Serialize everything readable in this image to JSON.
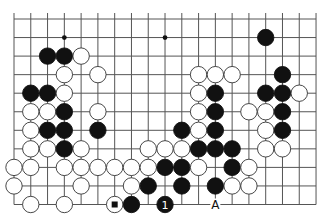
{
  "diagram": {
    "type": "go-board-partial",
    "columns": 19,
    "rows": 11,
    "open_edges": [
      "top"
    ],
    "grid": {
      "x0": 14,
      "y0": 19,
      "dx": 16.78,
      "dy": 18.55,
      "extend_top": 6
    },
    "colors": {
      "line": "#555555",
      "black": "#111111",
      "white": "#ffffff",
      "stone_outline": "#333333",
      "background": "#ffffff"
    },
    "star_points": [
      [
        3,
        1
      ],
      [
        9,
        1
      ],
      [
        15,
        1
      ],
      [
        3,
        7
      ],
      [
        9,
        7
      ],
      [
        15,
        7
      ]
    ],
    "stones": [
      {
        "c": 15,
        "r": 1,
        "color": "black"
      },
      {
        "c": 2,
        "r": 2,
        "color": "black"
      },
      {
        "c": 3,
        "r": 2,
        "color": "black"
      },
      {
        "c": 4,
        "r": 2,
        "color": "white"
      },
      {
        "c": 3,
        "r": 3,
        "color": "white"
      },
      {
        "c": 5,
        "r": 3,
        "color": "white"
      },
      {
        "c": 11,
        "r": 3,
        "color": "white"
      },
      {
        "c": 12,
        "r": 3,
        "color": "white"
      },
      {
        "c": 13,
        "r": 3,
        "color": "white"
      },
      {
        "c": 16,
        "r": 3,
        "color": "black"
      },
      {
        "c": 1,
        "r": 4,
        "color": "black"
      },
      {
        "c": 2,
        "r": 4,
        "color": "black"
      },
      {
        "c": 3,
        "r": 4,
        "color": "white"
      },
      {
        "c": 11,
        "r": 4,
        "color": "white"
      },
      {
        "c": 12,
        "r": 4,
        "color": "black"
      },
      {
        "c": 15,
        "r": 4,
        "color": "black"
      },
      {
        "c": 16,
        "r": 4,
        "color": "black"
      },
      {
        "c": 17,
        "r": 4,
        "color": "white"
      },
      {
        "c": 1,
        "r": 5,
        "color": "white"
      },
      {
        "c": 2,
        "r": 5,
        "color": "white"
      },
      {
        "c": 3,
        "r": 5,
        "color": "black"
      },
      {
        "c": 5,
        "r": 5,
        "color": "white"
      },
      {
        "c": 11,
        "r": 5,
        "color": "white"
      },
      {
        "c": 12,
        "r": 5,
        "color": "black"
      },
      {
        "c": 14,
        "r": 5,
        "color": "white"
      },
      {
        "c": 15,
        "r": 5,
        "color": "white"
      },
      {
        "c": 16,
        "r": 5,
        "color": "black"
      },
      {
        "c": 1,
        "r": 6,
        "color": "white"
      },
      {
        "c": 2,
        "r": 6,
        "color": "black"
      },
      {
        "c": 3,
        "r": 6,
        "color": "black"
      },
      {
        "c": 5,
        "r": 6,
        "color": "black"
      },
      {
        "c": 10,
        "r": 6,
        "color": "black"
      },
      {
        "c": 11,
        "r": 6,
        "color": "white"
      },
      {
        "c": 12,
        "r": 6,
        "color": "black"
      },
      {
        "c": 15,
        "r": 6,
        "color": "white"
      },
      {
        "c": 16,
        "r": 6,
        "color": "black"
      },
      {
        "c": 1,
        "r": 7,
        "color": "white"
      },
      {
        "c": 2,
        "r": 7,
        "color": "white"
      },
      {
        "c": 3,
        "r": 7,
        "color": "black"
      },
      {
        "c": 4,
        "r": 7,
        "color": "white"
      },
      {
        "c": 8,
        "r": 7,
        "color": "white"
      },
      {
        "c": 9,
        "r": 7,
        "color": "white"
      },
      {
        "c": 10,
        "r": 7,
        "color": "white"
      },
      {
        "c": 11,
        "r": 7,
        "color": "black"
      },
      {
        "c": 12,
        "r": 7,
        "color": "black"
      },
      {
        "c": 13,
        "r": 7,
        "color": "black"
      },
      {
        "c": 15,
        "r": 7,
        "color": "white"
      },
      {
        "c": 16,
        "r": 7,
        "color": "white"
      },
      {
        "c": 0,
        "r": 8,
        "color": "white"
      },
      {
        "c": 1,
        "r": 8,
        "color": "white"
      },
      {
        "c": 3,
        "r": 8,
        "color": "white"
      },
      {
        "c": 4,
        "r": 8,
        "color": "white"
      },
      {
        "c": 5,
        "r": 8,
        "color": "white"
      },
      {
        "c": 6,
        "r": 8,
        "color": "white"
      },
      {
        "c": 7,
        "r": 8,
        "color": "white"
      },
      {
        "c": 8,
        "r": 8,
        "color": "white"
      },
      {
        "c": 9,
        "r": 8,
        "color": "black"
      },
      {
        "c": 10,
        "r": 8,
        "color": "black"
      },
      {
        "c": 11,
        "r": 8,
        "color": "white"
      },
      {
        "c": 13,
        "r": 8,
        "color": "black"
      },
      {
        "c": 14,
        "r": 8,
        "color": "white"
      },
      {
        "c": 0,
        "r": 9,
        "color": "white"
      },
      {
        "c": 4,
        "r": 9,
        "color": "white"
      },
      {
        "c": 7,
        "r": 9,
        "color": "white"
      },
      {
        "c": 8,
        "r": 9,
        "color": "black"
      },
      {
        "c": 10,
        "r": 9,
        "color": "black"
      },
      {
        "c": 12,
        "r": 9,
        "color": "black"
      },
      {
        "c": 13,
        "r": 9,
        "color": "white"
      },
      {
        "c": 14,
        "r": 9,
        "color": "white"
      },
      {
        "c": 1,
        "r": 10,
        "color": "white"
      },
      {
        "c": 3,
        "r": 10,
        "color": "white"
      },
      {
        "c": 6,
        "r": 10,
        "color": "white",
        "marker": "square"
      },
      {
        "c": 7,
        "r": 10,
        "color": "black"
      },
      {
        "c": 9,
        "r": 10,
        "color": "black",
        "label": "1"
      }
    ],
    "point_labels": [
      {
        "c": 12,
        "r": 10,
        "label": "A"
      }
    ]
  }
}
